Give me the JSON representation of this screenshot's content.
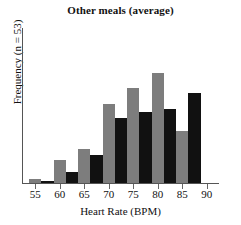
{
  "chart_data": {
    "type": "bar",
    "title": "Other meals (average)",
    "xlabel": "Heart Rate (BPM)",
    "ylabel": "Frequency (n = 53)",
    "xlim": [
      52.5,
      92.5
    ],
    "ylim": [
      0,
      9
    ],
    "xticks": [
      55,
      60,
      65,
      70,
      75,
      80,
      85,
      90
    ],
    "yticks": [],
    "grid": false,
    "legend": null,
    "bin_width": 2.5,
    "colors": {
      "gray": "#7d7d7d",
      "black": "#111111",
      "axis": "#555555"
    },
    "bars": [
      {
        "x0": 53.75,
        "x1": 56.25,
        "value": 0.25,
        "color": "gray"
      },
      {
        "x0": 56.25,
        "x1": 58.75,
        "value": 0.12,
        "color": "black"
      },
      {
        "x0": 58.75,
        "x1": 61.25,
        "value": 1.35,
        "color": "gray"
      },
      {
        "x0": 61.25,
        "x1": 63.75,
        "value": 0.65,
        "color": "black"
      },
      {
        "x0": 63.75,
        "x1": 66.25,
        "value": 1.95,
        "color": "gray"
      },
      {
        "x0": 66.25,
        "x1": 68.75,
        "value": 1.65,
        "color": "black"
      },
      {
        "x0": 68.75,
        "x1": 71.25,
        "value": 4.6,
        "color": "gray"
      },
      {
        "x0": 71.25,
        "x1": 73.75,
        "value": 3.8,
        "color": "black"
      },
      {
        "x0": 73.75,
        "x1": 76.25,
        "value": 5.5,
        "color": "gray"
      },
      {
        "x0": 76.25,
        "x1": 78.75,
        "value": 4.1,
        "color": "black"
      },
      {
        "x0": 78.75,
        "x1": 81.25,
        "value": 6.4,
        "color": "gray"
      },
      {
        "x0": 81.25,
        "x1": 83.75,
        "value": 4.3,
        "color": "black"
      },
      {
        "x0": 83.75,
        "x1": 86.25,
        "value": 3.0,
        "color": "gray"
      },
      {
        "x0": 86.25,
        "x1": 88.75,
        "value": 5.2,
        "color": "black"
      },
      {
        "x0": 71.25,
        "x1": 73.75,
        "value": 0,
        "color": "none"
      },
      {
        "x0": 73.75,
        "x1": 76.25,
        "value": 0,
        "color": "none"
      }
    ],
    "series": [
      {
        "name": "gray",
        "x": [
          55,
          60,
          65,
          70,
          75,
          80,
          85
        ],
        "values": [
          0.25,
          1.35,
          1.95,
          4.6,
          5.5,
          3.4,
          1.95
        ]
      },
      {
        "name": "black",
        "x": [
          57.5,
          62.5,
          67.5,
          72.5,
          77.5,
          82.5,
          87.5
        ],
        "values": [
          0.12,
          0.65,
          1.65,
          4.3,
          5.2,
          2.9,
          2.4
        ]
      }
    ]
  }
}
